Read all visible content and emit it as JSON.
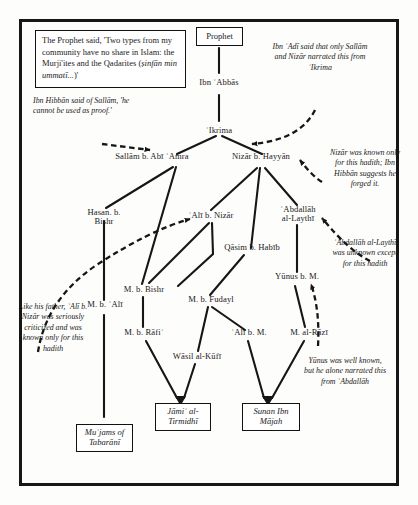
{
  "diagram": {
    "title_box": {
      "text_before": "The Prophet said, 'Two types from my community have no share in Islam: the Murji'ites and the Qadarites (",
      "text_italic": "ṣinfān min ummatī...",
      "text_after": ")'"
    },
    "nodes": [
      {
        "id": "prophet",
        "label": "Prophet",
        "kind": "box"
      },
      {
        "id": "ibn-abbas",
        "label": "Ibn ʿAbbās",
        "kind": "plain"
      },
      {
        "id": "ikrima",
        "label": "ʿIkrima",
        "kind": "plain"
      },
      {
        "id": "sallam",
        "label": "Sallām b. Abī ʿAmra",
        "kind": "plain"
      },
      {
        "id": "nizar",
        "label": "Nizār b. Hayyān",
        "kind": "plain"
      },
      {
        "id": "hasan-b-bishr",
        "label": "Hasan. b.\nBishr",
        "kind": "plain"
      },
      {
        "id": "ali-b-nizar",
        "label": "ʿAlī  b. Nizār",
        "kind": "plain"
      },
      {
        "id": "abdallah",
        "label": "ʿAbdallāh\nal-Laythī",
        "kind": "plain"
      },
      {
        "id": "qasim",
        "label": "Qāsim b. Habīb",
        "kind": "plain"
      },
      {
        "id": "m-b-bishr",
        "label": "M. b. Bishr",
        "kind": "plain"
      },
      {
        "id": "yunus",
        "label": "Yūnus b. M.",
        "kind": "plain"
      },
      {
        "id": "m-b-ali",
        "label": "M. b. ʿAlī",
        "kind": "plain"
      },
      {
        "id": "m-b-fudayl",
        "label": "M. b. Fudayl",
        "kind": "plain"
      },
      {
        "id": "m-b-rafi",
        "label": "M. b. Rāfiʿ",
        "kind": "plain"
      },
      {
        "id": "ali-b-m",
        "label": "ʿAlī b. M.",
        "kind": "plain"
      },
      {
        "id": "m-al-razi",
        "label": "M. al-Rāzī",
        "kind": "plain"
      },
      {
        "id": "wasil",
        "label": "Wāsil al-Kūfī",
        "kind": "plain"
      },
      {
        "id": "jami-tirmidhi",
        "label": "Jāmiʿ al-\nTirmidhī",
        "kind": "box-italic"
      },
      {
        "id": "sunan-ibn-majah",
        "label": "Sunan Ibn\nMājah",
        "kind": "box-italic"
      },
      {
        "id": "mujams",
        "label": "Muʿjams of\nTabarānī",
        "kind": "box-italic"
      }
    ],
    "annotations": [
      {
        "id": "ibn-hibban-sallam",
        "text": "Ibn Hibbān said of Sallām, 'he cannot be used as proof.'"
      },
      {
        "id": "ibn-adi",
        "text": "Ibn ʿAdī said that only Sallām and Nizār narrated this from ʿIkrima"
      },
      {
        "id": "nizar-known",
        "text": "Nizār was known only for this hadith; Ibn Hibbān suggests he forged it."
      },
      {
        "id": "ali-b-nizar-note",
        "text": "Like his father, ʿAlī b. Nizār was seriously criticized and was known only for this hadith"
      },
      {
        "id": "abdallah-note",
        "text": "ʿAbdallāh al-Laythī was unknown except for this hadith"
      },
      {
        "id": "yunus-note",
        "text": "Yūnus was well known, but he alone narrated this from ʿAbdallāh"
      }
    ],
    "colors": {
      "ink": "#161616",
      "background": "#fdfdfc",
      "box_border": "#121212"
    }
  }
}
